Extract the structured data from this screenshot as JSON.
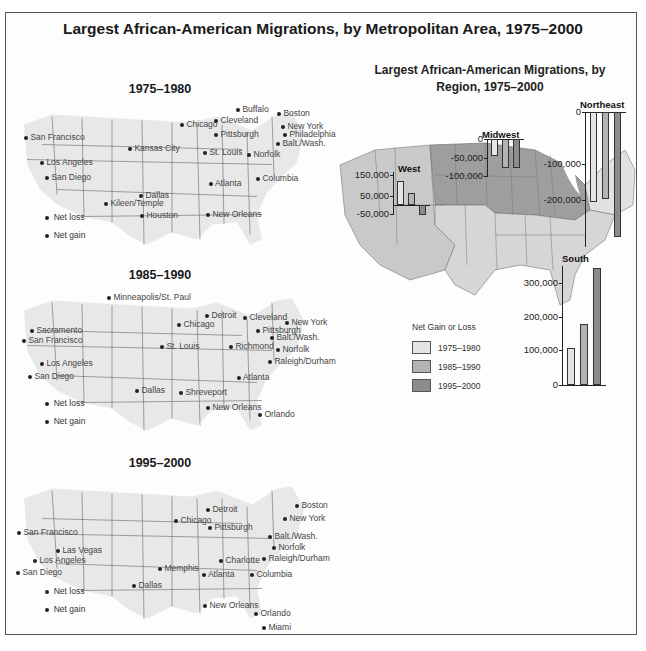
{
  "title": "Largest African-American Migrations, by Metropolitan Area, 1975–2000",
  "colors": {
    "period_1975_1980": "#e4e4e4",
    "period_1985_1990": "#b3b3b3",
    "period_1995_2000": "#8c8c8c",
    "map_land": "#e8e8e8",
    "region_west": "#c9c9c9",
    "region_midwest": "#9e9e9e",
    "region_northeast": "#e2e2e2",
    "region_south": "#d6d6d6"
  },
  "maps": [
    {
      "title": "1975–1980",
      "legend": {
        "loss": "Net loss",
        "gain": "Net gain"
      },
      "cities": [
        {
          "name": "San Francisco",
          "x": 24,
          "y": 137
        },
        {
          "name": "Los Angeles",
          "x": 40,
          "y": 162
        },
        {
          "name": "San Diego",
          "x": 45,
          "y": 177
        },
        {
          "name": "Kansas City",
          "x": 128,
          "y": 148
        },
        {
          "name": "Chicago",
          "x": 180,
          "y": 124
        },
        {
          "name": "St. Louis",
          "x": 203,
          "y": 152
        },
        {
          "name": "Buffalo",
          "x": 236,
          "y": 109
        },
        {
          "name": "Cleveland",
          "x": 214,
          "y": 120
        },
        {
          "name": "Pittsburgh",
          "x": 214,
          "y": 134
        },
        {
          "name": "Boston",
          "x": 277,
          "y": 113
        },
        {
          "name": "New York",
          "x": 281,
          "y": 126
        },
        {
          "name": "Philadelphia",
          "x": 283,
          "y": 134
        },
        {
          "name": "Balt./Wash.",
          "x": 276,
          "y": 143
        },
        {
          "name": "Norfolk",
          "x": 247,
          "y": 154
        },
        {
          "name": "Columbia",
          "x": 256,
          "y": 178
        },
        {
          "name": "Atlanta",
          "x": 209,
          "y": 183
        },
        {
          "name": "Dallas",
          "x": 139,
          "y": 195
        },
        {
          "name": "Kileen/Temple",
          "x": 104,
          "y": 203
        },
        {
          "name": "Houston",
          "x": 140,
          "y": 215
        },
        {
          "name": "New Orleans",
          "x": 206,
          "y": 214
        }
      ]
    },
    {
      "title": "1985–1990",
      "legend": {
        "loss": "Net loss",
        "gain": "Net gain"
      },
      "cities": [
        {
          "name": "Minneapolis/St. Paul",
          "x": 107,
          "y": 297
        },
        {
          "name": "Sacramento",
          "x": 30,
          "y": 330
        },
        {
          "name": "San Francisco",
          "x": 22,
          "y": 340
        },
        {
          "name": "Los Angeles",
          "x": 40,
          "y": 363
        },
        {
          "name": "San Diego",
          "x": 28,
          "y": 376
        },
        {
          "name": "Detroit",
          "x": 205,
          "y": 315
        },
        {
          "name": "Cleveland",
          "x": 243,
          "y": 317
        },
        {
          "name": "New York",
          "x": 285,
          "y": 322
        },
        {
          "name": "Chicago",
          "x": 177,
          "y": 324
        },
        {
          "name": "Pittsburgh",
          "x": 256,
          "y": 330
        },
        {
          "name": "Balt./Wash.",
          "x": 270,
          "y": 337
        },
        {
          "name": "St. Louis",
          "x": 160,
          "y": 346
        },
        {
          "name": "Richmond",
          "x": 229,
          "y": 346
        },
        {
          "name": "Norfolk",
          "x": 276,
          "y": 349
        },
        {
          "name": "Raleigh/Durham",
          "x": 268,
          "y": 361
        },
        {
          "name": "Atlanta",
          "x": 237,
          "y": 377
        },
        {
          "name": "Dallas",
          "x": 135,
          "y": 390
        },
        {
          "name": "Shreveport",
          "x": 179,
          "y": 392
        },
        {
          "name": "New Orleans",
          "x": 206,
          "y": 407
        },
        {
          "name": "Orlando",
          "x": 258,
          "y": 414
        }
      ]
    },
    {
      "title": "1995–2000",
      "legend": {
        "loss": "Net loss",
        "gain": "Net gain"
      },
      "cities": [
        {
          "name": "Boston",
          "x": 295,
          "y": 505
        },
        {
          "name": "Detroit",
          "x": 206,
          "y": 509
        },
        {
          "name": "Chicago",
          "x": 174,
          "y": 520
        },
        {
          "name": "New York",
          "x": 283,
          "y": 518
        },
        {
          "name": "San Francisco",
          "x": 17,
          "y": 532
        },
        {
          "name": "Pittsburgh",
          "x": 208,
          "y": 527
        },
        {
          "name": "Balt./Wash.",
          "x": 268,
          "y": 536
        },
        {
          "name": "Norfolk",
          "x": 272,
          "y": 547
        },
        {
          "name": "Las Vegas",
          "x": 56,
          "y": 550
        },
        {
          "name": "Los Angeles",
          "x": 33,
          "y": 560
        },
        {
          "name": "Raleigh/Durham",
          "x": 262,
          "y": 558
        },
        {
          "name": "Charlotte",
          "x": 219,
          "y": 560
        },
        {
          "name": "San Diego",
          "x": 16,
          "y": 572
        },
        {
          "name": "Memphis",
          "x": 158,
          "y": 568
        },
        {
          "name": "Columbia",
          "x": 250,
          "y": 574
        },
        {
          "name": "Atlanta",
          "x": 202,
          "y": 574
        },
        {
          "name": "Dallas",
          "x": 132,
          "y": 585
        },
        {
          "name": "New Orleans",
          "x": 203,
          "y": 605
        },
        {
          "name": "Orlando",
          "x": 254,
          "y": 613
        },
        {
          "name": "Miami",
          "x": 262,
          "y": 627
        }
      ]
    }
  ],
  "region_map": {
    "title_line1": "Largest African-American Migrations, by",
    "title_line2": "Region, 1975–2000",
    "legend_title": "Net Gain or Loss",
    "legend_items": [
      "1975–1980",
      "1985–1990",
      "1995–2000"
    ]
  },
  "chart_data": [
    {
      "type": "bar",
      "title": "West",
      "categories": [
        "1975–1980",
        "1985–1990",
        "1995–2000"
      ],
      "values": [
        100000,
        50000,
        -40000
      ],
      "ylabel": "Net Gain or Loss",
      "yticks": [
        "150,000",
        "50,000",
        "-50,000"
      ],
      "ylim": [
        -50000,
        150000
      ]
    },
    {
      "type": "bar",
      "title": "Midwest",
      "categories": [
        "1975–1980",
        "1985–1990",
        "1995–2000"
      ],
      "values": [
        -45000,
        -75000,
        -75000
      ],
      "ylabel": "Net Gain or Loss",
      "yticks": [
        "0",
        "-50,000",
        "-100,000"
      ],
      "ylim": [
        -100000,
        0
      ]
    },
    {
      "type": "bar",
      "title": "Northeast",
      "categories": [
        "1975–1980",
        "1985–1990",
        "1995–2000"
      ],
      "values": [
        -170000,
        -165000,
        -235000
      ],
      "ylabel": "Net Gain or Loss",
      "yticks": [
        "0",
        "-100,000",
        "-200,000"
      ],
      "ylim": [
        -250000,
        0
      ]
    },
    {
      "type": "bar",
      "title": "South",
      "categories": [
        "1975–1980",
        "1985–1990",
        "1995–2000"
      ],
      "values": [
        110000,
        180000,
        345000
      ],
      "ylabel": "Net Gain or Loss",
      "yticks": [
        "0",
        "100,000",
        "200,000",
        "300,000"
      ],
      "ylim": [
        0,
        350000
      ]
    }
  ]
}
